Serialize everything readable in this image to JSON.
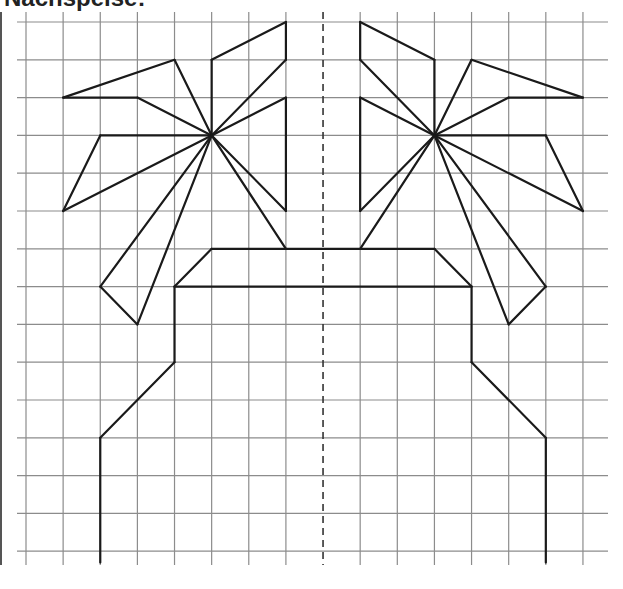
{
  "title": "Nachspeise:",
  "colors": {
    "grid": "#8c8c8c",
    "figure": "#1a1a1a",
    "axis": "#333333",
    "background": "#ffffff"
  },
  "grid": {
    "columns": 16,
    "rows": 15,
    "x0": 26,
    "y0": 22,
    "dx": 37.13,
    "dy": 37.8,
    "h_line_x_start": 17,
    "h_line_x_end": 608,
    "v_line_y_start": 12,
    "v_line_y_end": 565
  },
  "symmetry_axis": {
    "column": 8,
    "style": "dashed"
  },
  "figure": {
    "segments": [
      [
        [
          5,
          1
        ],
        [
          7,
          0
        ]
      ],
      [
        [
          7,
          0
        ],
        [
          7,
          1
        ]
      ],
      [
        [
          7,
          1
        ],
        [
          5,
          3
        ]
      ],
      [
        [
          5,
          1
        ],
        [
          5,
          3
        ]
      ],
      [
        [
          1,
          2
        ],
        [
          4,
          1
        ]
      ],
      [
        [
          4,
          1
        ],
        [
          5,
          3
        ]
      ],
      [
        [
          1,
          2
        ],
        [
          3,
          2
        ]
      ],
      [
        [
          3,
          2
        ],
        [
          5,
          3
        ]
      ],
      [
        [
          2,
          3
        ],
        [
          5,
          3
        ]
      ],
      [
        [
          2,
          3
        ],
        [
          1,
          5
        ]
      ],
      [
        [
          1,
          5
        ],
        [
          5,
          3
        ]
      ],
      [
        [
          7,
          2
        ],
        [
          5,
          3
        ]
      ],
      [
        [
          7,
          2
        ],
        [
          7,
          5
        ]
      ],
      [
        [
          7,
          5
        ],
        [
          5,
          3
        ]
      ],
      [
        [
          5,
          3
        ],
        [
          2,
          7
        ]
      ],
      [
        [
          2,
          7
        ],
        [
          3,
          8
        ]
      ],
      [
        [
          3,
          8
        ],
        [
          5,
          3
        ]
      ],
      [
        [
          5,
          3
        ],
        [
          7,
          6
        ]
      ],
      [
        [
          11,
          1
        ],
        [
          9,
          0
        ]
      ],
      [
        [
          9,
          0
        ],
        [
          9,
          1
        ]
      ],
      [
        [
          9,
          1
        ],
        [
          11,
          3
        ]
      ],
      [
        [
          11,
          1
        ],
        [
          11,
          3
        ]
      ],
      [
        [
          15,
          2
        ],
        [
          12,
          1
        ]
      ],
      [
        [
          12,
          1
        ],
        [
          11,
          3
        ]
      ],
      [
        [
          15,
          2
        ],
        [
          13,
          2
        ]
      ],
      [
        [
          13,
          2
        ],
        [
          11,
          3
        ]
      ],
      [
        [
          14,
          3
        ],
        [
          11,
          3
        ]
      ],
      [
        [
          14,
          3
        ],
        [
          15,
          5
        ]
      ],
      [
        [
          15,
          5
        ],
        [
          11,
          3
        ]
      ],
      [
        [
          9,
          2
        ],
        [
          11,
          3
        ]
      ],
      [
        [
          9,
          2
        ],
        [
          9,
          5
        ]
      ],
      [
        [
          9,
          5
        ],
        [
          11,
          3
        ]
      ],
      [
        [
          11,
          3
        ],
        [
          14,
          7
        ]
      ],
      [
        [
          14,
          7
        ],
        [
          13,
          8
        ]
      ],
      [
        [
          13,
          8
        ],
        [
          11,
          3
        ]
      ],
      [
        [
          11,
          3
        ],
        [
          9,
          6
        ]
      ],
      [
        [
          5,
          6
        ],
        [
          11,
          6
        ]
      ],
      [
        [
          5,
          6
        ],
        [
          4,
          7
        ]
      ],
      [
        [
          11,
          6
        ],
        [
          12,
          7
        ]
      ],
      [
        [
          4,
          7
        ],
        [
          12,
          7
        ]
      ],
      [
        [
          4,
          7
        ],
        [
          4,
          9
        ]
      ],
      [
        [
          4,
          9
        ],
        [
          2,
          11
        ]
      ],
      [
        [
          2,
          11
        ],
        [
          2,
          14.3
        ]
      ],
      [
        [
          12,
          7
        ],
        [
          12,
          9
        ]
      ],
      [
        [
          12,
          9
        ],
        [
          14,
          11
        ]
      ],
      [
        [
          14,
          11
        ],
        [
          14,
          14.3
        ]
      ]
    ]
  }
}
